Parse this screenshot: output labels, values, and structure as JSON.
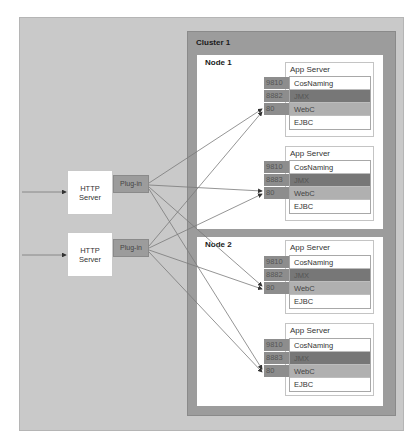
{
  "cluster": {
    "label": "Cluster 1"
  },
  "nodes": [
    {
      "label": "Node 1",
      "app_servers": [
        {
          "title": "App Server",
          "services": [
            {
              "port": "9810",
              "name": "CosNaming"
            },
            {
              "port": "8882",
              "name": "JMX"
            },
            {
              "port": "80",
              "name": "WebC"
            },
            {
              "port": "",
              "name": "EJBC"
            }
          ]
        },
        {
          "title": "App Server",
          "services": [
            {
              "port": "9810",
              "name": "CosNaming"
            },
            {
              "port": "8883",
              "name": "JMX"
            },
            {
              "port": "80",
              "name": "WebC"
            },
            {
              "port": "",
              "name": "EJBC"
            }
          ]
        }
      ]
    },
    {
      "label": "Node 2",
      "app_servers": [
        {
          "title": "App Server",
          "services": [
            {
              "port": "9810",
              "name": "CosNaming"
            },
            {
              "port": "8882",
              "name": "JMX"
            },
            {
              "port": "80",
              "name": "WebC"
            },
            {
              "port": "",
              "name": "EJBC"
            }
          ]
        },
        {
          "title": "App Server",
          "services": [
            {
              "port": "9810",
              "name": "CosNaming"
            },
            {
              "port": "8883",
              "name": "JMX"
            },
            {
              "port": "80",
              "name": "WebC"
            },
            {
              "port": "",
              "name": "EJBC"
            }
          ]
        }
      ]
    }
  ],
  "http_servers": [
    {
      "label_line1": "HTTP",
      "label_line2": "Server",
      "plugin_label": "Plug-in"
    },
    {
      "label_line1": "HTTP",
      "label_line2": "Server",
      "plugin_label": "Plug-in"
    }
  ],
  "colors": {
    "outer_panel": "#c9c9c9",
    "cluster_frame": "#9c9c9c",
    "port_cell": "#8d8d8d",
    "jmx_row": "#777777",
    "webc_row": "#b0b0b0",
    "connector": "#7a7a7a"
  }
}
